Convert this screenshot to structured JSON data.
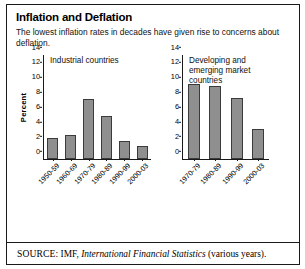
{
  "figure": {
    "title": "Inflation and Deflation",
    "subtitle": "The lowest inflation rates in decades have given rise to concerns about deflation.",
    "source_label": "SOURCE:",
    "source_pre": " IMF, ",
    "source_italic": "International Financial Statistics",
    "source_post": " (various years).",
    "border_color": "#1a1a1a",
    "bar_fill": "#8f8f8f",
    "bar_stroke": "#3b3b3b"
  },
  "chart_data": [
    {
      "type": "bar",
      "title": "Industrial countries",
      "xlabel": "",
      "ylabel": "Percent",
      "ylim": [
        0,
        14
      ],
      "yticks": [
        0,
        2,
        4,
        6,
        8,
        10,
        12,
        14
      ],
      "grid": false,
      "legend": "none",
      "categories": [
        "1950-59",
        "1960-69",
        "1970-79",
        "1980-89",
        "1990-99",
        "2000-03"
      ],
      "values": [
        2.8,
        3.2,
        8.1,
        5.8,
        2.4,
        1.7
      ]
    },
    {
      "type": "bar",
      "title": "Developing and\nemerging market countries",
      "xlabel": "",
      "ylabel": "",
      "ylim": [
        0,
        14
      ],
      "yticks": [
        0,
        2,
        4,
        6,
        8,
        10,
        12,
        14
      ],
      "grid": false,
      "legend": "none",
      "categories": [
        "1970-79",
        "1980-89",
        "1990-99",
        "2000-03"
      ],
      "values": [
        10.1,
        9.8,
        8.2,
        4.1
      ]
    }
  ]
}
